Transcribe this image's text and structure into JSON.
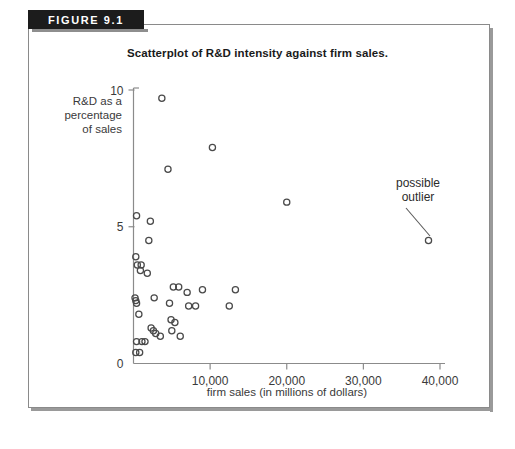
{
  "figure": {
    "banner_label": "FIGURE 9.1",
    "title": "Scatterplot of R&D intensity against firm sales."
  },
  "axes": {
    "y_caption_line1": "R&D as a",
    "y_caption_line2": "percentage",
    "y_caption_line3": "of sales",
    "x_caption": "firm sales (in millions of dollars)",
    "y_ticks": [
      "0",
      "5",
      "10"
    ],
    "x_ticks": [
      "10,000",
      "20,000",
      "30,000",
      "40,000"
    ]
  },
  "annotations": [
    {
      "name": "possible-outlier",
      "line1": "possible",
      "line2": "outlier"
    }
  ],
  "chart_data": {
    "type": "scatter",
    "title": "Scatterplot of R&D intensity against firm sales.",
    "xlabel": "firm sales (in millions of dollars)",
    "ylabel": "R&D as a percentage of sales",
    "xlim": [
      0,
      43000
    ],
    "ylim": [
      0,
      10
    ],
    "xticks": [
      10000,
      20000,
      30000,
      40000
    ],
    "yticks": [
      0,
      5,
      10
    ],
    "grid": false,
    "legend": null,
    "marker": "open-circle",
    "marker_color": "#4a4a4a",
    "points": [
      {
        "x": 3700,
        "y": 9.7
      },
      {
        "x": 10300,
        "y": 7.9
      },
      {
        "x": 4500,
        "y": 7.1
      },
      {
        "x": 20000,
        "y": 5.9
      },
      {
        "x": 400,
        "y": 5.4
      },
      {
        "x": 2200,
        "y": 5.2
      },
      {
        "x": 2000,
        "y": 4.5
      },
      {
        "x": 300,
        "y": 3.9
      },
      {
        "x": 500,
        "y": 3.6
      },
      {
        "x": 1000,
        "y": 3.6
      },
      {
        "x": 900,
        "y": 3.4
      },
      {
        "x": 1800,
        "y": 3.3
      },
      {
        "x": 38500,
        "y": 4.5
      },
      {
        "x": 5200,
        "y": 2.8
      },
      {
        "x": 5900,
        "y": 2.8
      },
      {
        "x": 7000,
        "y": 2.6
      },
      {
        "x": 9000,
        "y": 2.7
      },
      {
        "x": 13300,
        "y": 2.7
      },
      {
        "x": 200,
        "y": 2.4
      },
      {
        "x": 300,
        "y": 2.3
      },
      {
        "x": 2700,
        "y": 2.4
      },
      {
        "x": 400,
        "y": 2.2
      },
      {
        "x": 4700,
        "y": 2.2
      },
      {
        "x": 7200,
        "y": 2.1
      },
      {
        "x": 8100,
        "y": 2.1
      },
      {
        "x": 12500,
        "y": 2.1
      },
      {
        "x": 700,
        "y": 1.8
      },
      {
        "x": 4900,
        "y": 1.6
      },
      {
        "x": 5400,
        "y": 1.5
      },
      {
        "x": 2300,
        "y": 1.3
      },
      {
        "x": 2600,
        "y": 1.2
      },
      {
        "x": 5000,
        "y": 1.2
      },
      {
        "x": 2900,
        "y": 1.1
      },
      {
        "x": 3500,
        "y": 1.0
      },
      {
        "x": 6100,
        "y": 1.0
      },
      {
        "x": 400,
        "y": 0.8
      },
      {
        "x": 1100,
        "y": 0.8
      },
      {
        "x": 1500,
        "y": 0.8
      },
      {
        "x": 300,
        "y": 0.4
      },
      {
        "x": 800,
        "y": 0.4
      }
    ]
  }
}
